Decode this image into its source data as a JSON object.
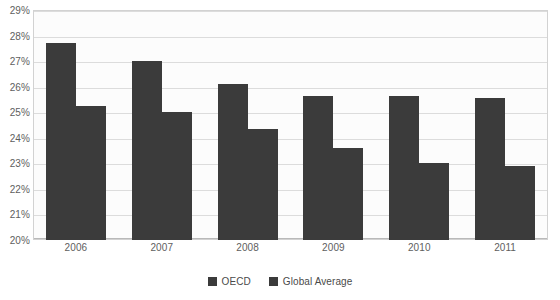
{
  "chart_data": {
    "type": "bar",
    "title": "",
    "subtitle": "",
    "xlabel": "",
    "ylabel": "",
    "categories": [
      "2006",
      "2007",
      "2008",
      "2009",
      "2010",
      "2011"
    ],
    "series": [
      {
        "name": "OECD",
        "color": "#3b3b3b",
        "values": [
          27.7,
          27.0,
          26.1,
          25.65,
          25.65,
          25.55
        ]
      },
      {
        "name": "Global Average",
        "color": "#3b3b3b",
        "values": [
          25.25,
          25.0,
          24.35,
          23.6,
          23.0,
          22.9
        ]
      }
    ],
    "ylim": [
      20,
      29
    ],
    "ytick_values": [
      20,
      21,
      22,
      23,
      24,
      25,
      26,
      27,
      28,
      29
    ],
    "ytick_labels": [
      "20%",
      "21%",
      "22%",
      "23%",
      "24%",
      "25%",
      "26%",
      "27%",
      "28%",
      "29%"
    ],
    "value_suffix": "%",
    "grid": true,
    "grid_axis": "y",
    "legend_position": "bottom",
    "annotations": []
  },
  "legend": {
    "items": [
      {
        "label": "OECD"
      },
      {
        "label": "Global Average"
      }
    ]
  },
  "colors": {
    "bar": "#3b3b3b",
    "gridline": "#dcdcdc",
    "plot_border": "#d2d2d2",
    "plot_background": "#fcfcfc",
    "tick_text": "#5e5e5e",
    "legend_text": "#4a4a4a",
    "page_background": "#ffffff"
  }
}
